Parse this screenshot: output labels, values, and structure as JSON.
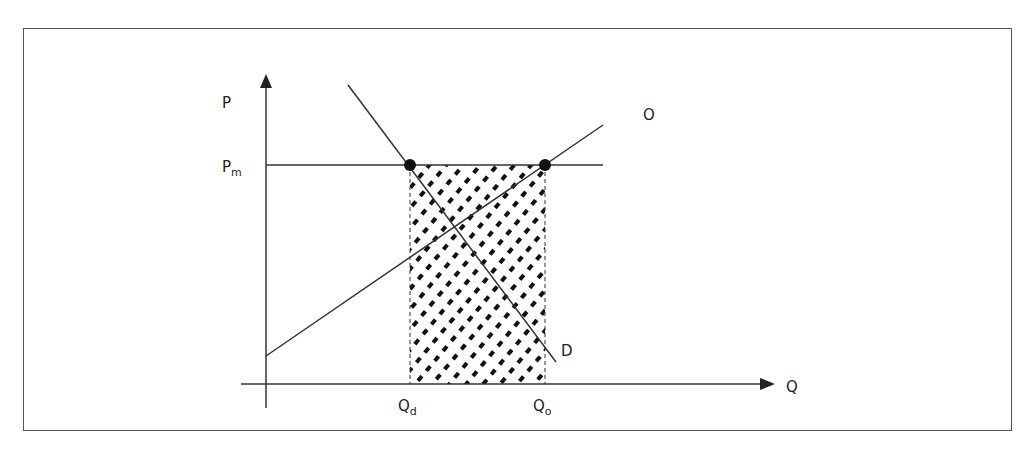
{
  "diagram": {
    "type": "supply-demand price floor",
    "axes": {
      "y_label": "P",
      "x_label": "Q"
    },
    "price_level": {
      "label": "P",
      "subscript": "m"
    },
    "curves": {
      "supply": {
        "label": "O"
      },
      "demand": {
        "label": "D"
      }
    },
    "quantities": {
      "demanded": {
        "label": "Q",
        "subscript": "d"
      },
      "offered": {
        "label": "Q",
        "subscript": "o"
      }
    },
    "shaded_region": "excess supply between Qd and Qo at Pm",
    "colors": {
      "line": "#333333",
      "dot": "#111111",
      "frame": "#555555",
      "background": "#ffffff"
    }
  }
}
